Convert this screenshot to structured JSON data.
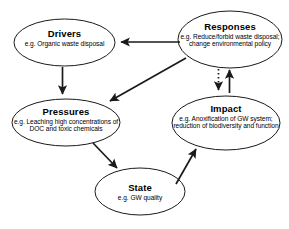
{
  "diagram": {
    "type": "dpsir-cycle-diagram",
    "background_color": "#ffffff",
    "stroke_color": "#1a1a1a",
    "nodes": [
      {
        "id": "drivers",
        "title": "Drivers",
        "description": "e.g. Organic waste disposal",
        "shape": "ellipse",
        "cx": 64.5,
        "cy": 42.5,
        "rx": 50.5,
        "ry": 23.5
      },
      {
        "id": "responses",
        "title": "Responses",
        "description": "e.g. Reduce/forbid waste disposal; change environmental policy",
        "shape": "ellipse",
        "cx": 230,
        "cy": 39.5,
        "rx": 52,
        "ry": 28.5
      },
      {
        "id": "pressures",
        "title": "Pressures",
        "description": "e.g. Leaching high concentrations of DOC and toxic chemicals",
        "shape": "ellipse",
        "cx": 66,
        "cy": 122.5,
        "rx": 54,
        "ry": 23.5
      },
      {
        "id": "impact",
        "title": "Impact",
        "description": "e.g. Anoxification of GW system; reduction of biodiversity and function",
        "shape": "ellipse",
        "cx": 226,
        "cy": 123,
        "rx": 54,
        "ry": 27
      },
      {
        "id": "state",
        "title": "State",
        "description": "e.g. GW quality",
        "shape": "ellipse",
        "cx": 140,
        "cy": 191.5,
        "rx": 45,
        "ry": 23.5
      }
    ],
    "arrows": [
      {
        "id": "responses-to-drivers",
        "from": "responses",
        "to": "drivers",
        "style": "solid",
        "direction": "left"
      },
      {
        "id": "responses-to-pressures",
        "from": "responses",
        "to": "pressures",
        "style": "solid",
        "direction": "down-left"
      },
      {
        "id": "drivers-to-pressures",
        "from": "drivers",
        "to": "pressures",
        "style": "solid",
        "direction": "down"
      },
      {
        "id": "responses-to-impact",
        "from": "responses",
        "to": "impact",
        "style": "dotted",
        "direction": "down"
      },
      {
        "id": "impact-to-responses",
        "from": "impact",
        "to": "responses",
        "style": "solid",
        "direction": "up"
      },
      {
        "id": "pressures-to-state",
        "from": "pressures",
        "to": "state",
        "style": "solid",
        "direction": "down-right"
      },
      {
        "id": "state-to-impact",
        "from": "state",
        "to": "impact",
        "style": "solid",
        "direction": "up-right"
      }
    ]
  }
}
